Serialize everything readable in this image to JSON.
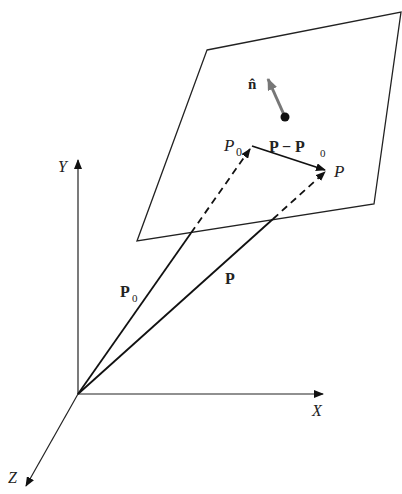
{
  "axes": {
    "x_label": "X",
    "y_label": "Y",
    "z_label": "Z",
    "origin": [
      78,
      394
    ],
    "x_end": [
      323,
      394
    ],
    "y_end": [
      78,
      160
    ],
    "z_end": [
      26,
      486
    ]
  },
  "plane": {
    "corners": [
      [
        207,
        50
      ],
      [
        401,
        12
      ],
      [
        374,
        204
      ],
      [
        137,
        241
      ]
    ]
  },
  "points": {
    "p0": {
      "label": "P",
      "sub": "0",
      "pos": [
        252,
        146
      ]
    },
    "p": {
      "label": "P",
      "pos": [
        327,
        170
      ]
    }
  },
  "vectors": {
    "p0_vec": {
      "label": "P",
      "sub": "0"
    },
    "p_vec": {
      "label": "P"
    },
    "diff": {
      "label_a": "P − P",
      "sub": "0"
    },
    "normal": {
      "label": "n̂",
      "base": [
        285,
        117
      ],
      "tip": [
        267,
        77
      ],
      "color": "#777777"
    }
  }
}
